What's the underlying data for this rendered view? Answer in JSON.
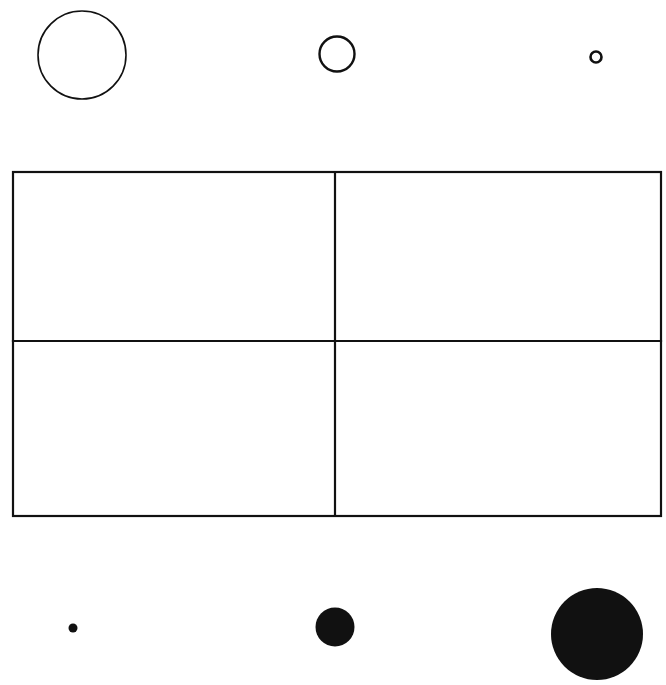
{
  "figure": {
    "background_color": "#ffffff",
    "ink_color": "#111111",
    "canvas": {
      "width": 666,
      "height": 685
    }
  },
  "top_row": {
    "label": "Outlined circles, decreasing size, left to right",
    "circles": [
      {
        "name": "large-outlined-circle",
        "cx": 82,
        "cy": 55,
        "r": 44,
        "stroke_width": 1.6,
        "size_label": "large"
      },
      {
        "name": "medium-outlined-circle",
        "cx": 337,
        "cy": 54,
        "r": 17.5,
        "stroke_width": 2.4,
        "size_label": "medium"
      },
      {
        "name": "small-outlined-circle",
        "cx": 596,
        "cy": 57,
        "r": 5.5,
        "stroke_width": 2.6,
        "size_label": "small"
      }
    ]
  },
  "grid": {
    "label": "Two by two rectangle grid",
    "x": 13,
    "y": 172,
    "width": 648,
    "height": 344,
    "rows": 2,
    "columns": 2,
    "divider_x": 335,
    "divider_y": 341,
    "line_width": 2.2,
    "cells": [
      {
        "name": "grid-cell-top-left",
        "row": 1,
        "column": 1
      },
      {
        "name": "grid-cell-top-right",
        "row": 1,
        "column": 2
      },
      {
        "name": "grid-cell-bottom-left",
        "row": 2,
        "column": 1
      },
      {
        "name": "grid-cell-bottom-right",
        "row": 2,
        "column": 2
      }
    ]
  },
  "bottom_row": {
    "label": "Filled circles, increasing size, left to right",
    "circles": [
      {
        "name": "small-filled-circle",
        "cx": 73,
        "cy": 628,
        "r": 4.5,
        "size_label": "small"
      },
      {
        "name": "medium-filled-circle",
        "cx": 335,
        "cy": 627,
        "r": 19.5,
        "size_label": "medium"
      },
      {
        "name": "large-filled-circle",
        "cx": 597,
        "cy": 634,
        "r": 46,
        "size_label": "large"
      }
    ]
  },
  "chart_data": {
    "type": "scatter",
    "xlabel": "",
    "ylabel": "",
    "series": [
      {
        "name": "outlined circles (top row)",
        "style": "outline",
        "x": [
          82,
          337,
          596
        ],
        "y": [
          55,
          54,
          57
        ],
        "radii": [
          44,
          17.5,
          5.5
        ]
      },
      {
        "name": "filled circles (bottom row)",
        "style": "filled",
        "x": [
          73,
          335,
          597
        ],
        "y": [
          628,
          627,
          634
        ],
        "radii": [
          4.5,
          19.5,
          46
        ]
      }
    ],
    "annotations": [
      "2x2 rectangular grid centered between the two circle rows"
    ],
    "grid": true,
    "legend": "none"
  }
}
